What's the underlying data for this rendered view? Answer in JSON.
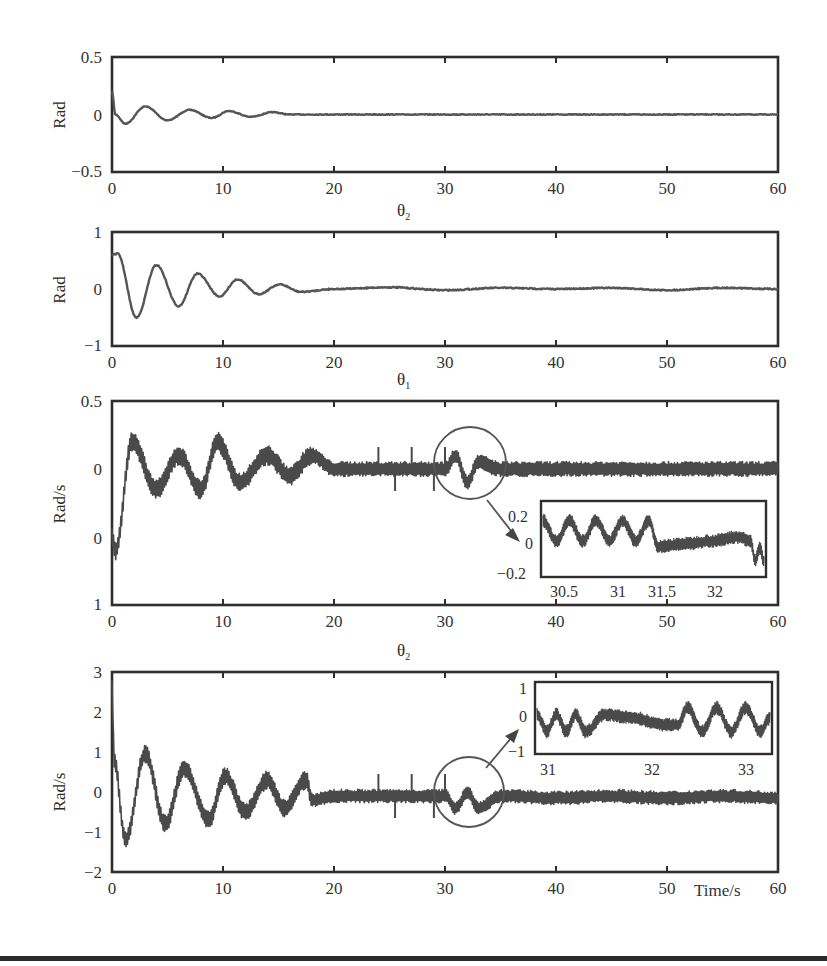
{
  "chart_data": [
    {
      "id": "panel1",
      "type": "line",
      "title": "",
      "xlabel": "",
      "ylabel": "Rad",
      "xlim": [
        0,
        60
      ],
      "ylim": [
        -0.5,
        0.5
      ],
      "x_ticks": [
        "0",
        "10",
        "20",
        "30",
        "40",
        "50",
        "60"
      ],
      "y_ticks": [
        "0.5",
        "0",
        "−0.5"
      ],
      "grid": false,
      "series": [
        {
          "name": "angle response (damped oscillation)",
          "x": [
            0,
            0.3,
            1.2,
            3,
            5,
            7,
            9,
            10.5,
            12.5,
            14.5,
            16,
            20,
            30,
            40,
            50,
            60
          ],
          "values": [
            0.2,
            0.0,
            -0.08,
            0.07,
            -0.05,
            0.04,
            -0.03,
            0.03,
            -0.02,
            0.02,
            0.0,
            0.0,
            0.0,
            0.0,
            0.0,
            0.0
          ]
        }
      ]
    },
    {
      "id": "panel2",
      "type": "line",
      "title": "θ₂",
      "xlabel": "",
      "ylabel": "Rad",
      "xlim": [
        0,
        60
      ],
      "ylim": [
        -1,
        1
      ],
      "x_ticks": [
        "0",
        "10",
        "20",
        "30",
        "40",
        "50",
        "60"
      ],
      "y_ticks": [
        "1",
        "0",
        "−1"
      ],
      "grid": false,
      "series": [
        {
          "name": "θ₂",
          "x": [
            0,
            0.5,
            2.2,
            4,
            6,
            7.7,
            9.7,
            11.3,
            13.2,
            15.1,
            17,
            20,
            25,
            30,
            35,
            40,
            45,
            50,
            55,
            60
          ],
          "values": [
            0.6,
            0.62,
            -0.5,
            0.42,
            -0.3,
            0.27,
            -0.13,
            0.17,
            -0.09,
            0.08,
            -0.05,
            0.0,
            0.03,
            -0.02,
            0.02,
            0.0,
            0.02,
            -0.02,
            0.02,
            0.0
          ]
        }
      ]
    },
    {
      "id": "panel3",
      "type": "line",
      "title": "θ₁",
      "xlabel": "",
      "ylabel": "Rad/s",
      "xlim": [
        0,
        60
      ],
      "ylim": [
        -1,
        0.5
      ],
      "x_ticks": [
        "0",
        "10",
        "20",
        "30",
        "40",
        "50",
        "60"
      ],
      "y_ticks": [
        "0.5",
        "0",
        "0",
        "1"
      ],
      "grid": false,
      "series": [
        {
          "name": "angular velocity (noisy)",
          "x": [
            0,
            0.3,
            1.8,
            4,
            6,
            8,
            9.5,
            11.5,
            14,
            16,
            18,
            20,
            25,
            30,
            31,
            32,
            33,
            35,
            40,
            45,
            50,
            55,
            60
          ],
          "values": [
            -0.5,
            -0.6,
            0.2,
            -0.15,
            0.1,
            -0.15,
            0.2,
            -0.1,
            0.1,
            -0.05,
            0.1,
            0.0,
            0.0,
            0.0,
            0.1,
            -0.1,
            0.05,
            0.0,
            0.0,
            0.0,
            0.0,
            0.0,
            0.0
          ]
        }
      ],
      "annotations": [
        {
          "type": "circle",
          "center_x": 32,
          "center_y": 0.0,
          "note": "zoomed region"
        },
        {
          "type": "arrow",
          "to": "inset"
        }
      ],
      "inset": {
        "xlim": [
          30.2,
          32.7
        ],
        "ylim": [
          -0.25,
          0.28
        ],
        "x_ticks": [
          "30.5",
          "31",
          "31.5",
          "32"
        ],
        "y_ticks": [
          "0.2",
          "0",
          "−0.2"
        ],
        "series": [
          {
            "name": "zoom",
            "x": [
              30.2,
              30.35,
              30.5,
              30.65,
              30.8,
              30.95,
              31.1,
              31.25,
              31.4,
              31.5,
              31.8,
              32.1,
              32.4,
              32.55,
              32.6,
              32.65,
              32.7
            ],
            "values": [
              0.15,
              0.0,
              0.15,
              0.0,
              0.15,
              0.0,
              0.15,
              0.0,
              0.15,
              -0.04,
              -0.02,
              0.0,
              0.03,
              0.0,
              -0.15,
              -0.05,
              -0.15
            ]
          }
        ]
      }
    },
    {
      "id": "panel4",
      "type": "line",
      "title": "θ₂",
      "xlabel": "Time/s",
      "ylabel": "Rad/s",
      "xlim": [
        0,
        60
      ],
      "ylim": [
        -2,
        3
      ],
      "x_ticks": [
        "0",
        "10",
        "20",
        "30",
        "40",
        "50",
        "60"
      ],
      "y_ticks": [
        "3",
        "2",
        "1",
        "0",
        "−1",
        "−2"
      ],
      "grid": false,
      "series": [
        {
          "name": "θ₂ angular velocity (noisy)",
          "x": [
            0,
            0.2,
            1.2,
            3,
            4.8,
            6.5,
            8.7,
            10.2,
            12,
            14,
            15.5,
            17.5,
            18,
            20,
            25,
            30,
            31,
            32,
            33,
            35,
            40,
            45,
            50,
            55,
            60
          ],
          "values": [
            2.6,
            0.8,
            -1.2,
            0.95,
            -0.8,
            0.6,
            -0.7,
            0.4,
            -0.5,
            0.3,
            -0.4,
            0.3,
            -0.2,
            -0.1,
            -0.1,
            -0.1,
            -0.4,
            0.0,
            -0.4,
            -0.1,
            -0.15,
            -0.1,
            -0.15,
            -0.1,
            -0.15
          ]
        }
      ],
      "annotations": [
        {
          "type": "circle",
          "center_x": 32,
          "center_y": -0.2,
          "note": "zoomed region"
        },
        {
          "type": "arrow",
          "to": "inset"
        }
      ],
      "inset": {
        "xlim": [
          30.8,
          33.2
        ],
        "ylim": [
          -1,
          1
        ],
        "x_ticks": [
          "31",
          "32",
          "33"
        ],
        "y_ticks": [
          "1",
          "0",
          "−1"
        ],
        "series": [
          {
            "name": "zoom",
            "x": [
              30.8,
              30.9,
              31.0,
              31.1,
              31.2,
              31.3,
              31.5,
              31.8,
              32.1,
              32.25,
              32.35,
              32.5,
              32.65,
              32.8,
              32.95,
              33.1,
              33.2
            ],
            "values": [
              0.1,
              -0.4,
              0.1,
              -0.4,
              0.1,
              -0.4,
              0.1,
              0.0,
              -0.2,
              -0.2,
              0.3,
              -0.4,
              0.3,
              -0.4,
              0.3,
              -0.4,
              0.0
            ]
          }
        ]
      }
    }
  ],
  "figure": {
    "panel1": {
      "ylabel": "Rad",
      "yticks": [
        "0.5",
        "0",
        "−0.5"
      ],
      "xticks": [
        "0",
        "10",
        "20",
        "30",
        "40",
        "50",
        "60"
      ]
    },
    "panel2": {
      "title_main": "θ",
      "title_sub": "2",
      "ylabel": "Rad",
      "yticks": [
        "1",
        "0",
        "−1"
      ],
      "xticks": [
        "0",
        "10",
        "20",
        "30",
        "40",
        "50",
        "60"
      ]
    },
    "panel3": {
      "title_main": "θ",
      "title_sub": "1",
      "ylabel": "Rad/s",
      "yticks": [
        "0.5",
        "0",
        "0",
        "1"
      ],
      "xticks": [
        "0",
        "10",
        "20",
        "30",
        "40",
        "50",
        "60"
      ],
      "inset_yticks": [
        "0.2",
        "0",
        "−0.2"
      ],
      "inset_xticks": [
        "30.5",
        "31",
        "31.5",
        "32"
      ]
    },
    "panel4": {
      "title_main": "θ",
      "title_sub": "2",
      "ylabel": "Rad/s",
      "yticks": [
        "3",
        "2",
        "1",
        "0",
        "−1",
        "−2"
      ],
      "xticks": [
        "0",
        "10",
        "20",
        "30",
        "40",
        "50",
        "60"
      ],
      "xlabel": "Time/s",
      "inset_yticks": [
        "1",
        "0",
        "−1"
      ],
      "inset_xticks": [
        "31",
        "32",
        "33"
      ]
    }
  },
  "colors": {
    "frame": "#2e2e2e",
    "trace": "#555555",
    "trace_dense": "#4a4a4a",
    "annotation": "#555555"
  }
}
